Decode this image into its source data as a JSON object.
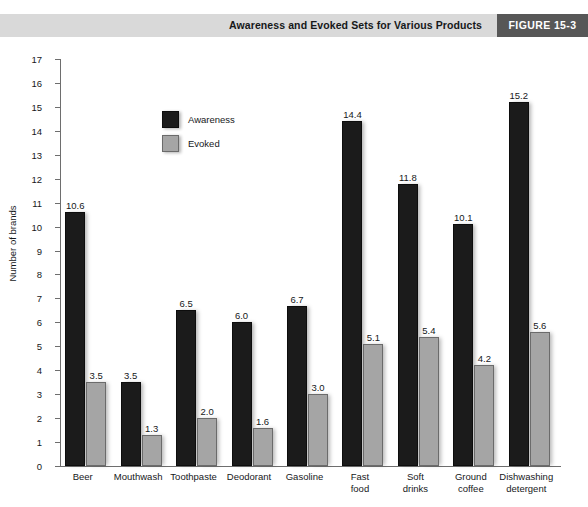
{
  "header": {
    "title": "Awareness and Evoked Sets for Various Products",
    "figure_badge": "FIGURE 15-3",
    "band_color": "#d9d9d9",
    "badge_color": "#575757"
  },
  "legend": {
    "position": "inside-top-left",
    "entries": [
      {
        "label": "Awareness",
        "color": "#1b1b1b",
        "icon": "legend-swatch-dark"
      },
      {
        "label": "Evoked",
        "color": "#a5a5a5",
        "icon": "legend-swatch-gray"
      }
    ]
  },
  "chart_data": {
    "type": "bar",
    "title": "Awareness and Evoked Sets for Various Products",
    "xlabel": "",
    "ylabel": "Number of brands",
    "ylim": [
      0,
      17
    ],
    "ytick_step": 1,
    "yticks": [
      0,
      1,
      2,
      3,
      4,
      5,
      6,
      7,
      8,
      9,
      10,
      11,
      12,
      13,
      14,
      15,
      16,
      17
    ],
    "grid": false,
    "categories": [
      "Beer",
      "Mouthwash",
      "Toothpaste",
      "Deodorant",
      "Gasoline",
      "Fast\nfood",
      "Soft\ndrinks",
      "Ground\ncoffee",
      "Dishwashing\ndetergent"
    ],
    "series": [
      {
        "name": "Awareness",
        "color": "#1b1b1b",
        "values": [
          10.6,
          3.5,
          6.5,
          6.0,
          6.7,
          14.4,
          11.8,
          10.1,
          15.2
        ],
        "labels": [
          "10.6",
          "3.5",
          "6.5",
          "6.0",
          "6.7",
          "14.4",
          "11.8",
          "10.1",
          "15.2"
        ]
      },
      {
        "name": "Evoked",
        "color": "#a5a5a5",
        "values": [
          3.5,
          1.3,
          2.0,
          1.6,
          3.0,
          5.1,
          5.4,
          4.2,
          5.6
        ],
        "labels": [
          "3.5",
          "1.3",
          "2.0",
          "1.6",
          "3.0",
          "5.1",
          "5.4",
          "4.2",
          "5.6"
        ]
      }
    ]
  }
}
